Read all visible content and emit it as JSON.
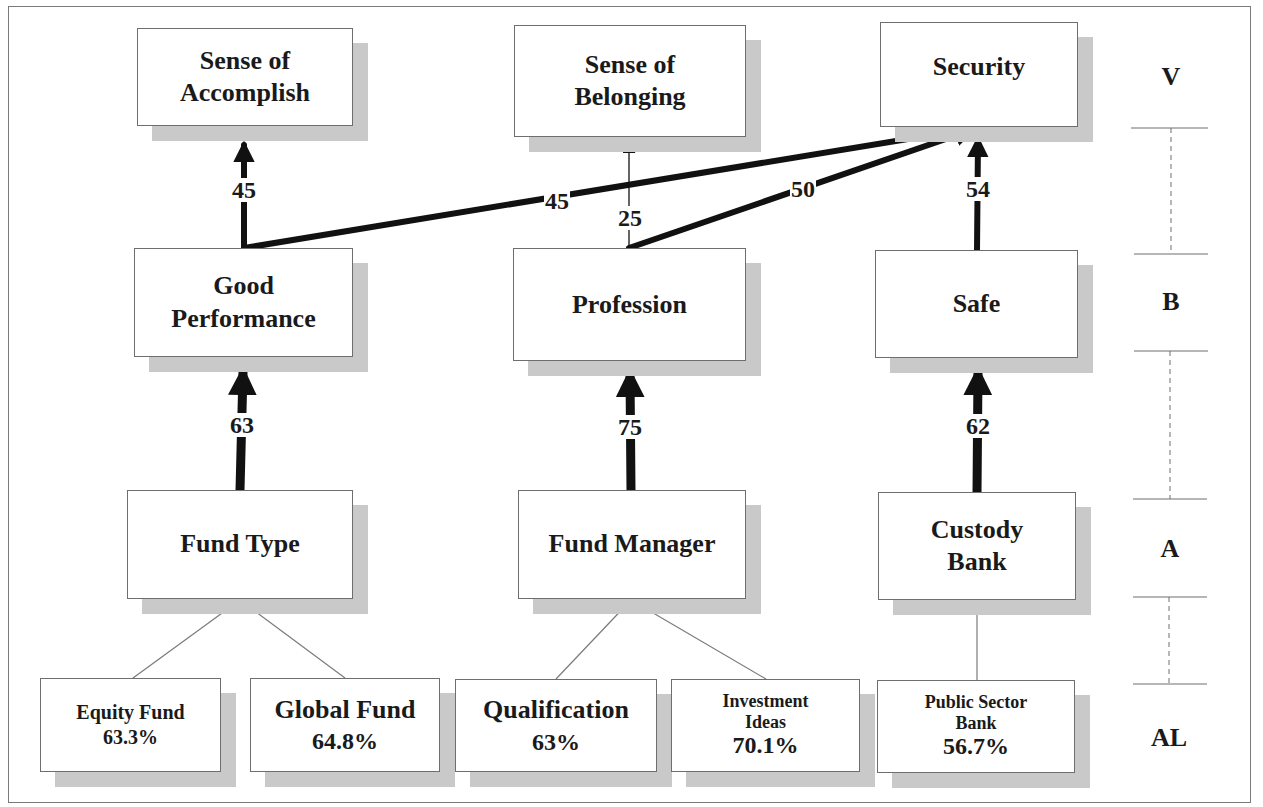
{
  "diagram": {
    "title_clipped": "",
    "levels": [
      {
        "id": "V",
        "label": "V"
      },
      {
        "id": "B",
        "label": "B"
      },
      {
        "id": "A",
        "label": "A"
      },
      {
        "id": "AL",
        "label": "AL"
      }
    ],
    "nodes": {
      "sense_of_accomplish": {
        "level": "V",
        "lines": [
          "Sense of",
          "Accomplish"
        ]
      },
      "sense_of_belonging": {
        "level": "V",
        "lines": [
          "Sense of",
          "Belonging"
        ]
      },
      "security": {
        "level": "V",
        "lines": [
          "Security"
        ]
      },
      "good_performance": {
        "level": "B",
        "lines": [
          "Good",
          "Performance"
        ]
      },
      "profession": {
        "level": "B",
        "lines": [
          "Profession"
        ]
      },
      "safe": {
        "level": "B",
        "lines": [
          "Safe"
        ]
      },
      "fund_type": {
        "level": "A",
        "lines": [
          "Fund Type"
        ]
      },
      "fund_manager": {
        "level": "A",
        "lines": [
          "Fund Manager"
        ]
      },
      "custody_bank": {
        "level": "A",
        "lines": [
          "Custody",
          "Bank"
        ]
      },
      "equity_fund": {
        "level": "AL",
        "lines": [
          "Equity Fund"
        ],
        "percent": "63.3%"
      },
      "global_fund": {
        "level": "AL",
        "lines": [
          "Global Fund"
        ],
        "percent": "64.8%"
      },
      "qualification": {
        "level": "AL",
        "lines": [
          "Qualification"
        ],
        "percent": "63%"
      },
      "investment_ideas": {
        "level": "AL",
        "lines": [
          "Investment",
          "Ideas"
        ],
        "percent": "70.1%"
      },
      "public_sector_bank": {
        "level": "AL",
        "lines": [
          "Public Sector",
          "Bank"
        ],
        "percent": "56.7%"
      }
    },
    "edges": [
      {
        "from": "fund_type",
        "to": "good_performance",
        "weight": "63"
      },
      {
        "from": "fund_manager",
        "to": "profession",
        "weight": "75"
      },
      {
        "from": "custody_bank",
        "to": "safe",
        "weight": "62"
      },
      {
        "from": "good_performance",
        "to": "sense_of_accomplish",
        "weight": "45"
      },
      {
        "from": "good_performance",
        "to": "security",
        "weight": "45"
      },
      {
        "from": "profession",
        "to": "sense_of_belonging",
        "weight": "25"
      },
      {
        "from": "profession",
        "to": "security",
        "weight": "50"
      },
      {
        "from": "safe",
        "to": "security",
        "weight": "54"
      }
    ],
    "attribute_links": [
      {
        "from": "fund_type",
        "to": "equity_fund"
      },
      {
        "from": "fund_type",
        "to": "global_fund"
      },
      {
        "from": "fund_manager",
        "to": "qualification"
      },
      {
        "from": "fund_manager",
        "to": "investment_ideas"
      },
      {
        "from": "custody_bank",
        "to": "public_sector_bank"
      }
    ],
    "colors": {
      "box_border": "#6e6e6e",
      "shadow": "#c9c9c9",
      "arrow": "#111111",
      "thin_line": "#7a7a7a"
    }
  }
}
